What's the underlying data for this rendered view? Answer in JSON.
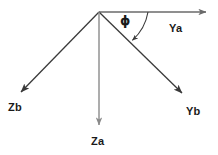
{
  "diagram": {
    "type": "vector-axes-diagram",
    "background_color": "#ffffff",
    "stroke_color": "#3a3a3a",
    "label_color": "#1a1a1a",
    "origin": {
      "x": 99,
      "y": 12
    },
    "labels": {
      "ya": "Ya",
      "yb": "Yb",
      "zb": "Zb",
      "za": "Za",
      "phi": "ϕ"
    },
    "vectors": [
      {
        "name": "Ya",
        "label": "Ya",
        "from": {
          "x": 99,
          "y": 12
        },
        "to": {
          "x": 208,
          "y": 12
        },
        "direction": "right-horizontal",
        "color": "#4a4a4a"
      },
      {
        "name": "Yb",
        "label": "Yb",
        "from": {
          "x": 99,
          "y": 12
        },
        "to": {
          "x": 185,
          "y": 96
        },
        "direction": "down-right",
        "color": "#3a3a3a"
      },
      {
        "name": "Zb",
        "label": "Zb",
        "from": {
          "x": 99,
          "y": 12
        },
        "to": {
          "x": 18,
          "y": 95
        },
        "direction": "down-left",
        "color": "#3a3a3a"
      },
      {
        "name": "Za",
        "label": "Za",
        "from": {
          "x": 99,
          "y": 12
        },
        "to": {
          "x": 99,
          "y": 128
        },
        "direction": "down-vertical",
        "color": "#8a8a8a"
      }
    ],
    "angle_arc": {
      "symbol": "ϕ",
      "between": [
        "Ya",
        "Yb"
      ],
      "start": {
        "x": 148,
        "y": 12
      },
      "end": {
        "x": 131,
        "y": 41
      },
      "radius": 49,
      "color": "#3a3a3a"
    }
  }
}
